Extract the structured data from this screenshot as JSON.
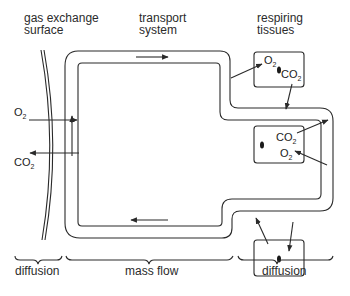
{
  "header_labels": {
    "gas_exchange": [
      "gas exchange",
      "surface"
    ],
    "transport": [
      "transport",
      "system"
    ],
    "tissues": [
      "respiring",
      "tissues"
    ]
  },
  "chemicals": {
    "o2": "O",
    "co2": "CO",
    "subscript": "2"
  },
  "bottom_labels": {
    "left": "diffusion",
    "middle": "mass flow",
    "right": "diffusion"
  },
  "colors": {
    "line": "#2a2a2a",
    "background": "#ffffff"
  }
}
